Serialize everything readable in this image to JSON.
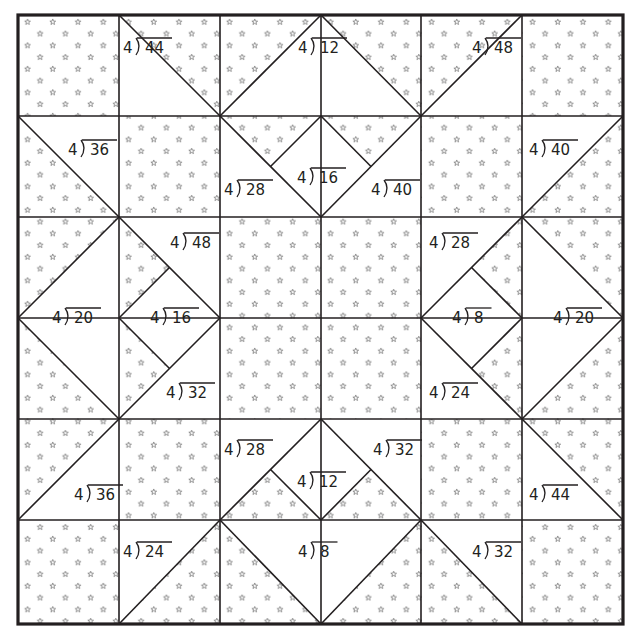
{
  "worksheet": {
    "title": "Division quilt pattern",
    "divisor_symbol": ")",
    "colors": {
      "line": "#231f20",
      "background": "#ffffff",
      "star": "#555555"
    },
    "problems": [
      {
        "id": "p1",
        "divisor": "4",
        "dividend": "44"
      },
      {
        "id": "p2",
        "divisor": "4",
        "dividend": "12"
      },
      {
        "id": "p3",
        "divisor": "4",
        "dividend": "48"
      },
      {
        "id": "p4",
        "divisor": "4",
        "dividend": "36"
      },
      {
        "id": "p5",
        "divisor": "4",
        "dividend": "16"
      },
      {
        "id": "p6",
        "divisor": "4",
        "dividend": "28"
      },
      {
        "id": "p7",
        "divisor": "4",
        "dividend": "40"
      },
      {
        "id": "p8",
        "divisor": "4",
        "dividend": "40"
      },
      {
        "id": "p9",
        "divisor": "4",
        "dividend": "48"
      },
      {
        "id": "p10",
        "divisor": "4",
        "dividend": "20"
      },
      {
        "id": "p11",
        "divisor": "4",
        "dividend": "16"
      },
      {
        "id": "p12",
        "divisor": "4",
        "dividend": "32"
      },
      {
        "id": "p13",
        "divisor": "4",
        "dividend": "28"
      },
      {
        "id": "p14",
        "divisor": "4",
        "dividend": "8"
      },
      {
        "id": "p15",
        "divisor": "4",
        "dividend": "24"
      },
      {
        "id": "p16",
        "divisor": "4",
        "dividend": "20"
      },
      {
        "id": "p17",
        "divisor": "4",
        "dividend": "28"
      },
      {
        "id": "p18",
        "divisor": "4",
        "dividend": "12"
      },
      {
        "id": "p19",
        "divisor": "4",
        "dividend": "32"
      },
      {
        "id": "p20",
        "divisor": "4",
        "dividend": "36"
      },
      {
        "id": "p21",
        "divisor": "4",
        "dividend": "44"
      },
      {
        "id": "p22",
        "divisor": "4",
        "dividend": "24"
      },
      {
        "id": "p23",
        "divisor": "4",
        "dividend": "8"
      },
      {
        "id": "p24",
        "divisor": "4",
        "dividend": "32"
      }
    ]
  }
}
